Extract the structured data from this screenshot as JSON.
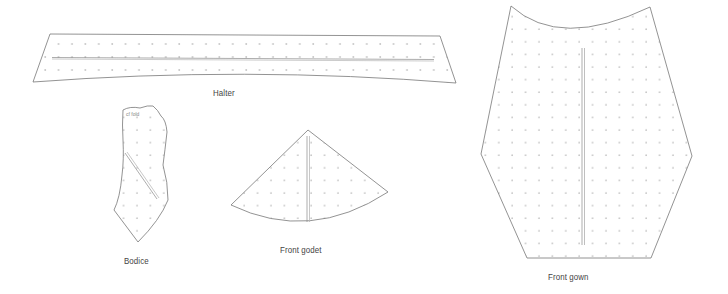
{
  "colors": {
    "outline": "#777777",
    "dots": "#c4c4c4",
    "grainline": "#9a9a9a",
    "label": "#444444"
  },
  "pieces": [
    {
      "id": "halter",
      "label": "Halter"
    },
    {
      "id": "bodice",
      "label": "Bodice",
      "annotation": "cf  fold"
    },
    {
      "id": "front-godet",
      "label": "Front godet"
    },
    {
      "id": "front-gown",
      "label": "Front gown"
    }
  ]
}
